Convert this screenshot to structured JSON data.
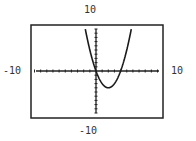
{
  "window": {
    "xmin": "-10",
    "xmax": "10",
    "ymin": "-10",
    "ymax": "10"
  },
  "colors": {
    "frame": "#222222",
    "axis": "#222222",
    "curve": "#1a1a1a",
    "label": "#333333",
    "background": "#ffffff"
  },
  "chart_data": {
    "type": "line",
    "title": "",
    "xlabel": "",
    "ylabel": "",
    "function": "y = x^2 - 4x",
    "xlim": [
      -10,
      10
    ],
    "ylim": [
      -10,
      10
    ],
    "grid": false,
    "legend": null,
    "tick_step": 1,
    "window_labels": {
      "left": "-10",
      "right": "10",
      "top": "10",
      "bottom": "-10"
    },
    "key_points": [
      {
        "name": "root-1",
        "x": 0,
        "y": 0
      },
      {
        "name": "root-2",
        "x": 4,
        "y": 0
      },
      {
        "name": "vertex",
        "x": 2,
        "y": -4
      },
      {
        "name": "exit-left",
        "x": -1.74,
        "y": 10
      },
      {
        "name": "exit-right",
        "x": 5.74,
        "y": 10
      }
    ]
  },
  "layout": {
    "frame": {
      "x": 31,
      "y": 25,
      "w": 132,
      "h": 93
    },
    "plot": {
      "x0": 36,
      "x1": 159,
      "y0": 29,
      "y1": 113,
      "origin_x": 96,
      "origin_y": 71
    }
  }
}
